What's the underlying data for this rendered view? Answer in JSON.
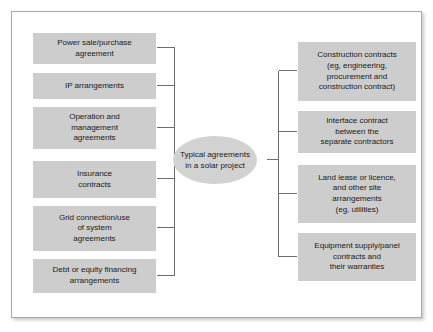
{
  "diagram": {
    "type": "hub-and-spoke flowchart",
    "hub": {
      "label": "Typical agreements\nin a solar project",
      "line1": "Typical agreements",
      "line2": "in a solar project"
    },
    "colors": {
      "node_fill": "#cdcdcd",
      "hub_fill": "#d2d2d2",
      "connector": "#6f6f6f",
      "frame_border": "#a8a8a8",
      "background": "#ffffff",
      "text": "#1b1b1b"
    },
    "left_nodes": [
      {
        "id": "power-sale-purchase-agreement",
        "text": "Power sale/purchase\nagreement"
      },
      {
        "id": "ip-arrangements",
        "text": "IP arrangements"
      },
      {
        "id": "operation-and-management-agreements",
        "text": "Operation and\nmanagement\nagreements"
      },
      {
        "id": "insurance-contracts",
        "text": "Insurance\ncontracts"
      },
      {
        "id": "grid-connection-use-of-system-agreements",
        "text": "Grid connection/use\nof system\nagreements"
      },
      {
        "id": "debt-or-equity-financing-arrangements",
        "text": "Debt or equity financing\narrangements"
      }
    ],
    "right_nodes": [
      {
        "id": "construction-contracts",
        "text": "Construction contracts\n(eg, engineering,\nprocurement and\nconstruction contract)"
      },
      {
        "id": "interface-contract",
        "text": "Interface contract\nbetween the\nseparate contractors"
      },
      {
        "id": "land-lease-or-licence",
        "text": "Land lease or licence,\nand other site\narrangements\n(eg, utilities)"
      },
      {
        "id": "equipment-supply-panel-contracts",
        "text": "Equipment supply/panel\ncontracts and\ntheir warranties"
      }
    ]
  }
}
